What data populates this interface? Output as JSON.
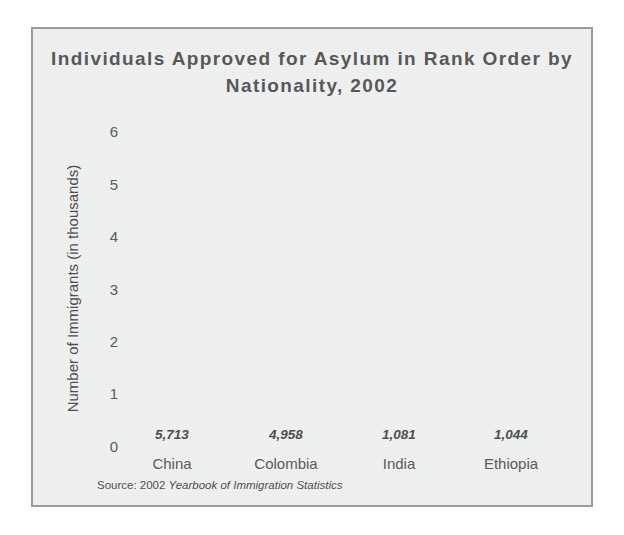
{
  "figure": {
    "title": "Individuals Approved for Asylum in\nRank Order by Nationality, 2002",
    "source_prefix": "Source: 2002 ",
    "source_title": "Yearbook of Immigration Statistics",
    "border_color": "#9a9b9c",
    "background_color": "#eff0f0"
  },
  "chart_data": {
    "type": "bar",
    "title": "Individuals Approved for Asylum in Rank Order by Nationality, 2002",
    "xlabel": "",
    "ylabel": "Number of Immigrants (in thousands)",
    "categories": [
      "China",
      "Colombia",
      "India",
      "Ethiopia"
    ],
    "values": [
      5.713,
      4.958,
      1.081,
      1.044
    ],
    "value_labels": [
      "5,713",
      "4,958",
      "1,081",
      "1,044"
    ],
    "ylim": [
      0,
      6
    ],
    "yticks": [
      "6",
      "5",
      "4",
      "3",
      "2",
      "1",
      "0"
    ],
    "ytick_values": [
      6,
      5,
      4,
      3,
      2,
      1,
      0
    ],
    "grid": false,
    "legend": null,
    "bar_color": "#4a4a4a",
    "units": "thousands"
  }
}
